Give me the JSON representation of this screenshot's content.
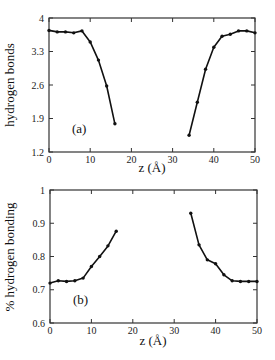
{
  "chart_data": [
    {
      "type": "line",
      "panel": "(a)",
      "title": "",
      "xlabel": "z (Å)",
      "ylabel": "hydrogen bonds",
      "xlim": [
        0,
        50
      ],
      "ylim": [
        1.2,
        4
      ],
      "xticks": [
        0,
        10,
        20,
        30,
        40,
        50
      ],
      "yticks": [
        1.2,
        1.9,
        2.6,
        3.3,
        4
      ],
      "ytick_labels": [
        "1.2",
        "1.9",
        "2.6",
        "3.3",
        "4"
      ],
      "grid": false,
      "legend": null,
      "annotation": "(a)",
      "series": [
        {
          "name": "left segment",
          "x": [
            0,
            2,
            4,
            6,
            8,
            10,
            12,
            14,
            16
          ],
          "values": [
            3.74,
            3.71,
            3.71,
            3.69,
            3.73,
            3.5,
            3.12,
            2.58,
            1.79
          ]
        },
        {
          "name": "right segment",
          "x": [
            34,
            36,
            38,
            40,
            42,
            44,
            46,
            48,
            50
          ],
          "values": [
            1.55,
            2.24,
            2.93,
            3.39,
            3.62,
            3.66,
            3.73,
            3.73,
            3.69
          ]
        }
      ]
    },
    {
      "type": "line",
      "panel": "(b)",
      "title": "",
      "xlabel": "z (Å)",
      "ylabel": "% hydrogen bonding",
      "xlim": [
        0,
        50
      ],
      "ylim": [
        0.6,
        1
      ],
      "xticks": [
        0,
        10,
        20,
        30,
        40,
        50
      ],
      "yticks": [
        0.6,
        0.7,
        0.8,
        0.9,
        1
      ],
      "ytick_labels": [
        "0.6",
        "0.7",
        "0.8",
        "0.9",
        "1"
      ],
      "grid": false,
      "legend": null,
      "annotation": "(b)",
      "series": [
        {
          "name": "left segment",
          "x": [
            0,
            2,
            4,
            6,
            8,
            10,
            12,
            14,
            16
          ],
          "values": [
            0.72,
            0.727,
            0.725,
            0.727,
            0.735,
            0.77,
            0.8,
            0.832,
            0.876
          ]
        },
        {
          "name": "right segment",
          "x": [
            34,
            36,
            38,
            40,
            42,
            44,
            46,
            48,
            50
          ],
          "values": [
            0.93,
            0.835,
            0.79,
            0.778,
            0.745,
            0.727,
            0.725,
            0.725,
            0.725
          ]
        }
      ]
    }
  ],
  "panels": {
    "a": {
      "label": "(a)",
      "ylabel": "hydrogen bonds",
      "xlabel": "z (Å)",
      "xtick_labels": [
        "0",
        "10",
        "20",
        "30",
        "40",
        "50"
      ],
      "ytick_labels": [
        "1.2",
        "1.9",
        "2.6",
        "3.3",
        "4"
      ]
    },
    "b": {
      "label": "(b)",
      "ylabel": "% hydrogen bonding",
      "xlabel": "z (Å)",
      "xtick_labels": [
        "0",
        "10",
        "20",
        "30",
        "40",
        "50"
      ],
      "ytick_labels": [
        "0.6",
        "0.7",
        "0.8",
        "0.9",
        "1"
      ]
    }
  },
  "colors": {
    "line": "#111111",
    "axis": "#333333",
    "background": "#ffffff"
  }
}
